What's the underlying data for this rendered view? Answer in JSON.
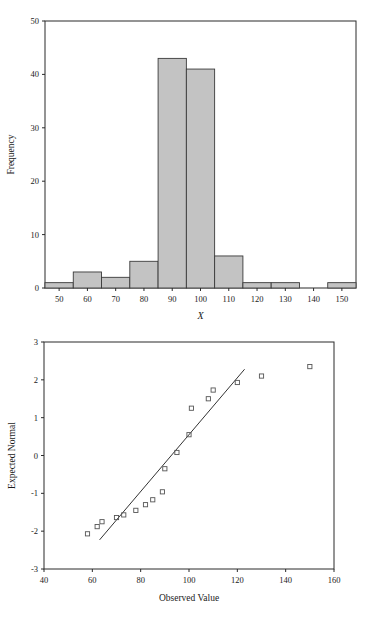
{
  "figure": {
    "background": "#ffffff",
    "panel_count": 2
  },
  "chart_data": [
    {
      "type": "bar",
      "name": "histogram-panel",
      "title": "",
      "xlabel": "X",
      "ylabel": "Frequency",
      "categories": [
        "50",
        "60",
        "70",
        "80",
        "90",
        "100",
        "110",
        "120",
        "130",
        "140",
        "150"
      ],
      "bin_centers": [
        50,
        60,
        70,
        80,
        90,
        100,
        110,
        120,
        130,
        140,
        150
      ],
      "bin_width": 10,
      "values": [
        1,
        3,
        2,
        5,
        43,
        41,
        6,
        1,
        1,
        0,
        1
      ],
      "xlim": [
        45,
        155
      ],
      "ylim": [
        0,
        50
      ],
      "xticks": [
        50,
        60,
        70,
        80,
        90,
        100,
        110,
        120,
        130,
        140,
        150
      ],
      "yticks": [
        0,
        10,
        20,
        30,
        40,
        50
      ],
      "ytick_labels": [
        "0",
        "10",
        "20",
        "30",
        "40",
        "50"
      ],
      "xtick_labels": [
        "50",
        "60",
        "70",
        "80",
        "90",
        "100",
        "110",
        "120",
        "130",
        "140",
        "150"
      ],
      "bar_fill": "#c3c3c3",
      "bar_stroke": "#3a3a3a",
      "grid": false,
      "legend": "none"
    },
    {
      "type": "scatter",
      "name": "normal-qq-panel",
      "title": "",
      "xlabel": "Observed Value",
      "ylabel": "Expected Normal",
      "xlim": [
        40,
        160
      ],
      "ylim": [
        -3,
        3
      ],
      "xticks": [
        40,
        60,
        80,
        100,
        120,
        140,
        160
      ],
      "yticks": [
        -3,
        -2,
        -1,
        0,
        1,
        2,
        3
      ],
      "xtick_labels": [
        "40",
        "60",
        "80",
        "100",
        "120",
        "140",
        "160"
      ],
      "ytick_labels": [
        "-3",
        "-2",
        "-1",
        "0",
        "1",
        "2",
        "3"
      ],
      "marker": "open-square",
      "marker_color": "#555555",
      "grid": false,
      "legend": "none",
      "points": [
        {
          "x": 58,
          "y": -2.07
        },
        {
          "x": 62,
          "y": -1.88
        },
        {
          "x": 64,
          "y": -1.75
        },
        {
          "x": 70,
          "y": -1.64
        },
        {
          "x": 73,
          "y": -1.57
        },
        {
          "x": 78,
          "y": -1.45
        },
        {
          "x": 82,
          "y": -1.3
        },
        {
          "x": 85,
          "y": -1.17
        },
        {
          "x": 89,
          "y": -0.96
        },
        {
          "x": 90,
          "y": -0.35
        },
        {
          "x": 95,
          "y": 0.08
        },
        {
          "x": 100,
          "y": 0.55
        },
        {
          "x": 101,
          "y": 1.25
        },
        {
          "x": 108,
          "y": 1.5
        },
        {
          "x": 110,
          "y": 1.73
        },
        {
          "x": 120,
          "y": 1.93
        },
        {
          "x": 130,
          "y": 2.1
        },
        {
          "x": 150,
          "y": 2.35
        }
      ],
      "reference_line": {
        "x1": 63,
        "y1": -2.23,
        "x2": 123,
        "y2": 2.28
      }
    }
  ]
}
